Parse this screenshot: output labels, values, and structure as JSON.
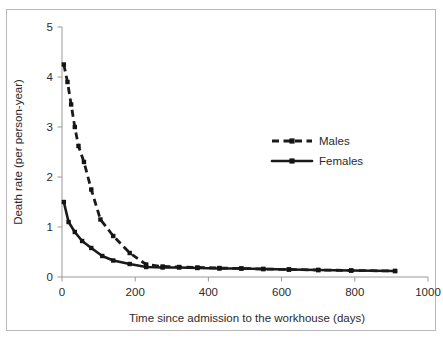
{
  "figure": {
    "background_color": "#ffffff",
    "frame_color": "#b9b9b9",
    "axis_color": "#9a9a9a",
    "series_color": "#1a1a1a"
  },
  "axes": {
    "y_title": "Death rate (per person-year)",
    "x_title": "Time since admission to the workhouse (days)",
    "y_ticks": [
      "0",
      "1",
      "2",
      "3",
      "4",
      "5"
    ],
    "x_ticks": [
      "0",
      "200",
      "400",
      "600",
      "800",
      "1000"
    ]
  },
  "legend": {
    "entries": [
      {
        "label": "Males",
        "style": "dashed",
        "marker": "square"
      },
      {
        "label": "Females",
        "style": "solid",
        "marker": "square"
      }
    ]
  },
  "chart_data": {
    "type": "line",
    "title": "",
    "subtitle": "",
    "xlabel": "Time since admission to the workhouse (days)",
    "ylabel": "Death rate (per person-year)",
    "xlim": [
      0,
      1000
    ],
    "ylim": [
      0,
      5
    ],
    "xticks": [
      0,
      200,
      400,
      600,
      800,
      1000
    ],
    "yticks": [
      0,
      1,
      2,
      3,
      4,
      5
    ],
    "grid": false,
    "legend_position": "inside-upper-right",
    "annotations": [],
    "series": [
      {
        "name": "Males",
        "line_style": "dashed",
        "marker": "square",
        "color": "#1a1a1a",
        "x": [
          5,
          15,
          25,
          35,
          45,
          60,
          80,
          105,
          140,
          185,
          230,
          275,
          320,
          370,
          430,
          490,
          550,
          620,
          700,
          790,
          910
        ],
        "y": [
          4.25,
          3.9,
          3.45,
          3.0,
          2.62,
          2.3,
          1.75,
          1.15,
          0.82,
          0.48,
          0.25,
          0.21,
          0.2,
          0.19,
          0.18,
          0.17,
          0.16,
          0.15,
          0.14,
          0.13,
          0.12
        ]
      },
      {
        "name": "Females",
        "line_style": "solid",
        "marker": "square",
        "color": "#1a1a1a",
        "x": [
          5,
          18,
          35,
          55,
          80,
          110,
          140,
          185,
          230,
          275,
          320,
          370,
          430,
          490,
          550,
          620,
          700,
          790,
          910
        ],
        "y": [
          1.5,
          1.1,
          0.9,
          0.72,
          0.58,
          0.42,
          0.33,
          0.26,
          0.2,
          0.19,
          0.19,
          0.18,
          0.17,
          0.17,
          0.16,
          0.15,
          0.14,
          0.13,
          0.12
        ]
      }
    ]
  }
}
